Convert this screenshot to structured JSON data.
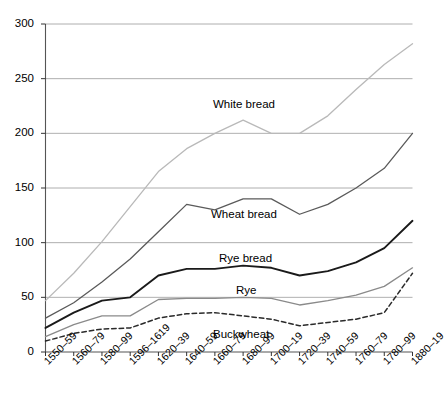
{
  "chart_data": {
    "type": "line",
    "title": "",
    "xlabel": "",
    "ylabel": "",
    "ylim": [
      0,
      300
    ],
    "yticks": [
      0,
      50,
      100,
      150,
      200,
      250,
      300
    ],
    "grid": true,
    "legend_position": "inline-labels",
    "categories": [
      "1550–59",
      "1560–79",
      "1580–99",
      "1596–1619",
      "1620–39",
      "1640–59",
      "1660–79",
      "1680–99",
      "1700–19",
      "1720–39",
      "1740–59",
      "1760–79",
      "1780–99",
      "1880–19"
    ],
    "series": [
      {
        "name": "White bread",
        "color": "#b9b9b9",
        "style": "solid",
        "values": [
          47,
          72,
          101,
          133,
          165,
          186,
          200,
          212,
          200,
          200,
          216,
          240,
          263,
          282
        ]
      },
      {
        "name": "Wheat bread",
        "color": "#5a5a5a",
        "style": "solid",
        "values": [
          31,
          45,
          64,
          85,
          110,
          135,
          130,
          140,
          140,
          126,
          135,
          150,
          168,
          200
        ]
      },
      {
        "name": "Rye bread",
        "color": "#1a1a1a",
        "style": "solid",
        "values": [
          22,
          36,
          47,
          50,
          70,
          76,
          76,
          79,
          77,
          70,
          74,
          82,
          95,
          120
        ]
      },
      {
        "name": "Rye",
        "color": "#8a8a8a",
        "style": "solid",
        "values": [
          14,
          25,
          33,
          33,
          48,
          49,
          49,
          50,
          49,
          43,
          47,
          52,
          60,
          77
        ]
      },
      {
        "name": "Buckwheat",
        "color": "#2a2a2a",
        "style": "dashed",
        "values": [
          10,
          17,
          21,
          22,
          31,
          35,
          36,
          33,
          30,
          24,
          27,
          30,
          36,
          72
        ]
      }
    ],
    "series_label_positions": [
      {
        "name": "White bread",
        "left": 213,
        "top": 99
      },
      {
        "name": "Wheat bread",
        "left": 211,
        "top": 209
      },
      {
        "name": "Rye bread",
        "left": 219,
        "top": 253
      },
      {
        "name": "Rye",
        "left": 236,
        "top": 285
      },
      {
        "name": "Buckwheat",
        "left": 213,
        "top": 329
      }
    ]
  }
}
